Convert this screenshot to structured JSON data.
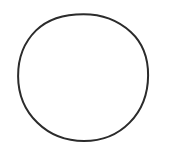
{
  "canvas": {
    "width": 169,
    "height": 147,
    "background_color": "#ffffff",
    "description": "circle-outline-figure"
  },
  "figure": {
    "name": "circle-outline",
    "shape_type": "circle",
    "stroke_color": "#2b2b2b",
    "stroke_width": 2,
    "fill": "none",
    "center_x": 83,
    "center_y": 77.5,
    "radius_x": 65,
    "radius_y": 63.5,
    "bounds": {
      "left": 18,
      "top": 14,
      "right": 148,
      "bottom": 141
    },
    "label": ""
  }
}
